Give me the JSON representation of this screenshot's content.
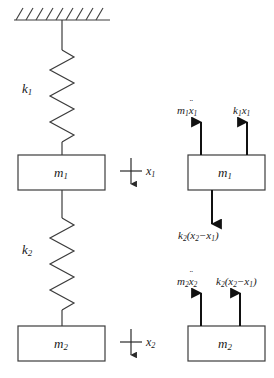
{
  "figure": {
    "type": "two-mass-spring-free-body-diagram",
    "line_color": "#3c3c3c",
    "text_color": "#1a1a1a",
    "background": "#ffffff"
  },
  "system": {
    "support": {
      "name": "fixed-ceiling",
      "hatch_marks": 9
    },
    "springs": [
      {
        "id": "k1",
        "label_base": "k",
        "label_sub": "1",
        "coils": 6
      },
      {
        "id": "k2",
        "label_base": "k",
        "label_sub": "2",
        "coils": 5
      }
    ],
    "masses": [
      {
        "id": "m1",
        "label_base": "m",
        "label_sub": "1"
      },
      {
        "id": "m2",
        "label_base": "m",
        "label_sub": "2"
      }
    ],
    "displacements": [
      {
        "id": "x1",
        "label_base": "x",
        "label_sub": "1",
        "direction": "down"
      },
      {
        "id": "x2",
        "label_base": "x",
        "label_sub": "2",
        "direction": "down"
      }
    ]
  },
  "free_body_diagrams": [
    {
      "id": "fbd-m1",
      "mass_label_base": "m",
      "mass_label_sub": "1",
      "forces": [
        {
          "id": "inertia-force-m1",
          "direction": "up",
          "parts": {
            "base": "m",
            "sub": "1",
            "var": "x",
            "var_sub": "1",
            "dots": "¨"
          },
          "text": "m1 ẍ 1"
        },
        {
          "id": "spring-force-k1x1",
          "direction": "up",
          "parts": {
            "base": "k",
            "sub": "1",
            "var": "x",
            "var_sub": "1"
          },
          "text": "k1 x1"
        },
        {
          "id": "spring-force-k2-dx",
          "direction": "down",
          "parts": {
            "base": "k",
            "sub": "2",
            "expr_var1": "x",
            "expr_sub1": "2",
            "expr_var2": "x",
            "expr_sub2": "1",
            "op": "−"
          },
          "text": "k2(x2−x1)"
        }
      ]
    },
    {
      "id": "fbd-m2",
      "mass_label_base": "m",
      "mass_label_sub": "2",
      "forces": [
        {
          "id": "inertia-force-m2",
          "direction": "up",
          "parts": {
            "base": "m",
            "sub": "2",
            "var": "x",
            "var_sub": "2",
            "dots": "¨"
          },
          "text": "m2 ẍ 2"
        },
        {
          "id": "spring-force-k2-dx-on-m2",
          "direction": "up",
          "parts": {
            "base": "k",
            "sub": "2",
            "expr_var1": "x",
            "expr_sub1": "2",
            "expr_var2": "x",
            "expr_sub2": "1",
            "op": "−"
          },
          "text": "k2(x2−x1)"
        }
      ]
    }
  ],
  "labels": {
    "k1": "k",
    "k1_sub": "1",
    "k2": "k",
    "k2_sub": "2",
    "m1": "m",
    "m1_sub": "1",
    "m2": "m",
    "m2_sub": "2",
    "x1": "x",
    "x1_sub": "1",
    "x2": "x",
    "x2_sub": "2",
    "fbd_m1": "m",
    "fbd_m1_sub": "1",
    "fbd_m2": "m",
    "fbd_m2_sub": "2",
    "force_m1ddx1_base": "m",
    "force_m1ddx1_sub": "1",
    "force_m1ddx1_var": "x",
    "force_m1ddx1_varsub": "1",
    "force_k1x1_base": "k",
    "force_k1x1_sub": "1",
    "force_k1x1_var": "x",
    "force_k1x1_varsub": "1",
    "force_k2dx_base": "k",
    "force_k2dx_sub": "2",
    "force_k2dx_open": "(",
    "force_k2dx_v1": "x",
    "force_k2dx_v1sub": "2",
    "force_k2dx_op": "−",
    "force_k2dx_v2": "x",
    "force_k2dx_v2sub": "1",
    "force_k2dx_close": ")",
    "force_m2ddx2_base": "m",
    "force_m2ddx2_sub": "2",
    "force_m2ddx2_var": "x",
    "force_m2ddx2_varsub": "2",
    "force_k2dx2_base": "k",
    "force_k2dx2_sub": "2",
    "force_k2dx2_open": "(",
    "force_k2dx2_v1": "x",
    "force_k2dx2_v1sub": "2",
    "force_k2dx2_op": "−",
    "force_k2dx2_v2": "x",
    "force_k2dx2_v2sub": "1",
    "force_k2dx2_close": ")",
    "dots": "¨"
  }
}
